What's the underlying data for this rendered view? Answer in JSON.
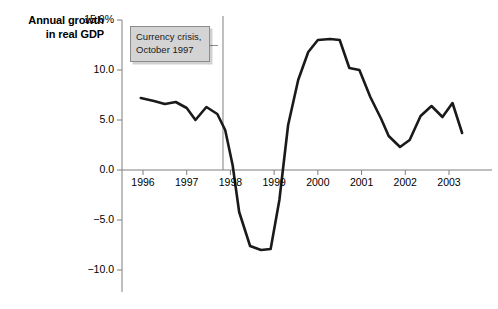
{
  "chart_data": {
    "type": "line",
    "title": "",
    "ylabel": "Annual growth in real GDP",
    "ylabel_line1": "Annual growth",
    "ylabel_line2": "in real GDP",
    "xlabel": "",
    "ylim": [
      -11.5,
      15.0
    ],
    "xlim": [
      1995.72,
      2003.35
    ],
    "grid": false,
    "legend": null,
    "ytick_labels": [
      "15.0%",
      "10.0",
      "5.0",
      "0.0",
      "-5.0",
      "-10.0"
    ],
    "ytick_values": [
      15.0,
      10.0,
      5.0,
      0.0,
      -5.0,
      -10.0
    ],
    "xtick_labels": [
      "1996",
      "1997",
      "1998",
      "1999",
      "2000",
      "2001",
      "2002",
      "2003"
    ],
    "xtick_values": [
      1996,
      1997,
      1998,
      1999,
      2000,
      2001,
      2002,
      2003
    ],
    "series": [
      {
        "name": "Annual growth in real GDP",
        "color": "#1a1a1a",
        "x": [
          1995.95,
          1996.25,
          1996.5,
          1996.75,
          1997.0,
          1997.2,
          1997.45,
          1997.7,
          1997.88,
          1998.05,
          1998.2,
          1998.45,
          1998.7,
          1998.92,
          1999.12,
          1999.32,
          1999.55,
          1999.78,
          2000.0,
          2000.28,
          2000.5,
          2000.72,
          2000.95,
          2001.2,
          2001.45,
          2001.62,
          2001.88,
          2002.1,
          2002.35,
          2002.6,
          2002.85,
          2003.08,
          2003.3
        ],
        "values": [
          7.2,
          6.9,
          6.6,
          6.8,
          6.2,
          5.0,
          6.3,
          5.6,
          4.0,
          0.5,
          -4.2,
          -7.6,
          -8.0,
          -7.9,
          -3.0,
          4.5,
          9.0,
          11.8,
          13.0,
          13.1,
          13.0,
          10.2,
          10.0,
          7.3,
          5.1,
          3.4,
          2.3,
          3.0,
          5.4,
          6.4,
          5.3,
          6.7,
          3.7
        ]
      }
    ],
    "annotations": [
      {
        "id": "currency-crisis",
        "text_line1": "Currency crisis,",
        "text_line2": "October 1997",
        "x_value": 1997.83,
        "type": "vertical-line-with-label"
      }
    ]
  },
  "colors": {
    "line": "#1a1a1a",
    "axis": "#7f7f7f",
    "annotation_fill": "#d4d4d4",
    "annotation_border": "#8c8c8c",
    "text": "#000000"
  }
}
